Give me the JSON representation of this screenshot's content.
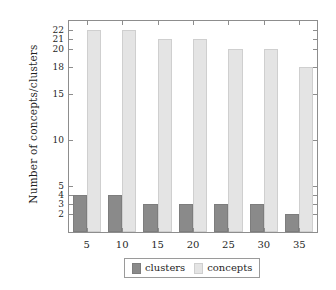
{
  "chart_data": {
    "type": "bar",
    "title": "",
    "xlabel": "",
    "ylabel": "Number of concepts/clusters",
    "categories": [
      "5",
      "10",
      "15",
      "20",
      "25",
      "30",
      "35"
    ],
    "series": [
      {
        "name": "clusters",
        "color": "#8a8a8a",
        "values": [
          4,
          4,
          3,
          3,
          3,
          3,
          2
        ]
      },
      {
        "name": "concepts",
        "color": "#e4e4e4",
        "values": [
          22,
          22,
          21,
          21,
          20,
          20,
          18
        ]
      }
    ],
    "ylim": [
      0,
      23
    ],
    "yticks": [
      2,
      3,
      4,
      5,
      10,
      15,
      18,
      20,
      21,
      22
    ],
    "ytick_labels": [
      "2",
      "3",
      "4",
      "5",
      "10",
      "15",
      "18",
      "20",
      "21",
      "22"
    ],
    "xtick_labels": [
      "5",
      "10",
      "15",
      "20",
      "25",
      "30",
      "35"
    ],
    "grid": false,
    "legend_position": "bottom-center",
    "legend_entries": [
      "clusters",
      "concepts"
    ]
  }
}
